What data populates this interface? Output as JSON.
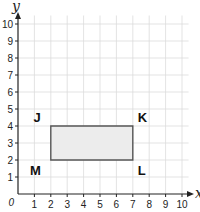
{
  "chart_data": {
    "type": "scatter",
    "title": "",
    "xlabel": "x",
    "ylabel": "y",
    "xlim": [
      0,
      10
    ],
    "ylim": [
      0,
      10
    ],
    "grid": true,
    "origin_label": "0",
    "x_ticks": [
      "1",
      "2",
      "3",
      "4",
      "5",
      "6",
      "7",
      "8",
      "9",
      "10"
    ],
    "y_ticks": [
      "1",
      "2",
      "3",
      "4",
      "5",
      "6",
      "7",
      "8",
      "9",
      "10"
    ],
    "shape": {
      "type": "rectangle",
      "fill": "#ececec",
      "stroke": "#555555",
      "vertices": [
        {
          "label": "J",
          "x": 2,
          "y": 4
        },
        {
          "label": "K",
          "x": 7,
          "y": 4
        },
        {
          "label": "L",
          "x": 7,
          "y": 2
        },
        {
          "label": "M",
          "x": 2,
          "y": 2
        }
      ]
    }
  },
  "layout": {
    "x0": 18,
    "y0": 194,
    "xstep": 16.4,
    "ystep": 17
  }
}
